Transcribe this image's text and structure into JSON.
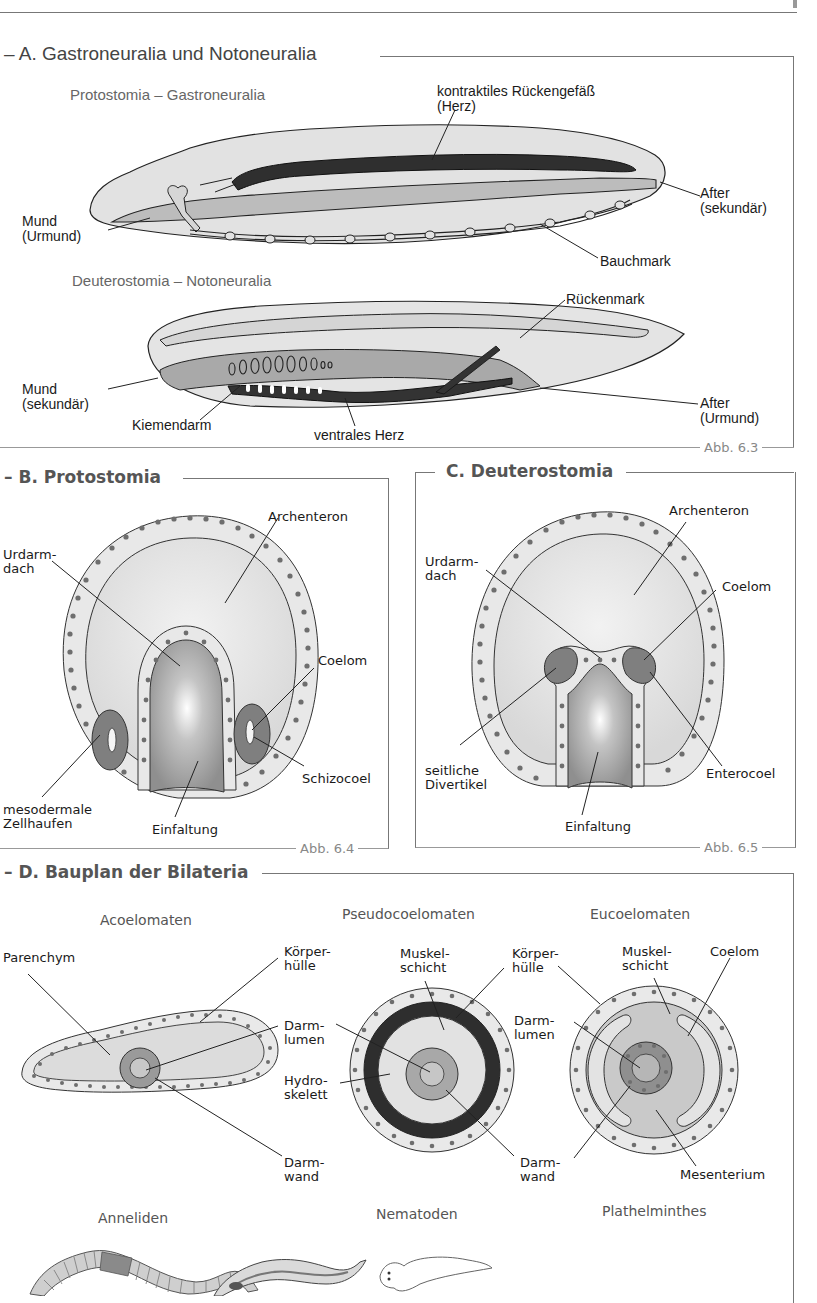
{
  "page": {
    "header_rule": true
  },
  "section_a": {
    "title": "– A. Gastroneuralia und Notoneuralia",
    "figure_label": "Abb. 6.3",
    "protostomia": {
      "title": "Protostomia – Gastroneuralia",
      "labels": {
        "heart": "kontraktiles Rückengefäß\n(Herz)",
        "mouth": "Mund\n(Urmund)",
        "anus": "After\n(sekundär)",
        "nerve_cord": "Bauchmark"
      }
    },
    "deuterostomia": {
      "title": "Deuterostomia – Notoneuralia",
      "labels": {
        "spinal_cord": "Rückenmark",
        "mouth": "Mund\n(sekundär)",
        "anus": "After\n(Urmund)",
        "gill_gut": "Kiemendarm",
        "ventral_heart": "ventrales Herz"
      }
    }
  },
  "section_b": {
    "title": "– B. Protostomia",
    "figure_label": "Abb. 6.4",
    "labels": {
      "archenteron": "Archenteron",
      "roof": "Urdarm-\ndach",
      "coelom": "Coelom",
      "schizocoel": "Schizocoel",
      "mesoderm": "mesodermale\nZellhaufen",
      "invagination": "Einfaltung"
    }
  },
  "section_c": {
    "title": "C. Deuterostomia",
    "figure_label": "Abb. 6.5",
    "labels": {
      "archenteron": "Archenteron",
      "roof": "Urdarm-\ndach",
      "coelom": "Coelom",
      "diverticula": "seitliche\nDivertikel",
      "enterocoel": "Enterocoel",
      "invagination": "Einfaltung"
    }
  },
  "section_d": {
    "title": "– D. Bauplan der Bilateria",
    "acoelomates": {
      "title": "Acoelomaten",
      "labels": {
        "parenchyma": "Parenchym",
        "body_wall": "Körper-\nhülle",
        "gut_lumen": "Darm-\nlumen",
        "gut_wall": "Darm-\nwand"
      },
      "example": "Anneliden"
    },
    "pseudocoelomates": {
      "title": "Pseudocoelomaten",
      "labels": {
        "muscle": "Muskel-\nschicht",
        "body_wall": "Körper-\nhülle",
        "hydroskeleton": "Hydro-\nskelett",
        "gut_wall": "Darm-\nwand"
      },
      "example": "Nematoden"
    },
    "eucoelomates": {
      "title": "Eucoelomaten",
      "labels": {
        "muscle": "Muskel-\nschicht",
        "coelom": "Coelom",
        "gut_lumen": "Darm-\nlumen",
        "mesentery": "Mesenterium"
      },
      "example": "Plathelminthes"
    }
  },
  "colors": {
    "frame": "#777777",
    "title_gray": "#555555",
    "fill_light": "#e4e4e4",
    "fill_mid": "#bdbdbd",
    "fill_dark": "#3a3a3a",
    "cell_fill": "#ebebeb",
    "nucleus": "#6b6b6b",
    "mesoderm": "#7e7e7e"
  }
}
